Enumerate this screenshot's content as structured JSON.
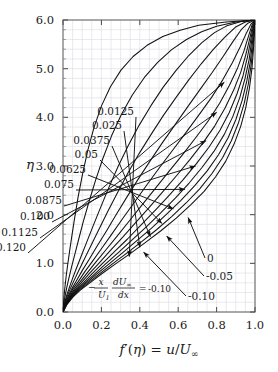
{
  "figure": {
    "background_color": "#ffffff",
    "frame_color": "#555555",
    "grid_color": "#d8d8e0",
    "curve_color": "#111111"
  },
  "chart_data": {
    "type": "line",
    "title": "",
    "subtitle": "",
    "xlabel": "f'(η) = u/U∞",
    "ylabel": "η",
    "xlim": [
      0.0,
      1.0
    ],
    "ylim": [
      0.0,
      6.0
    ],
    "xticks": [
      0.0,
      0.2,
      0.4,
      0.6,
      0.8,
      1.0
    ],
    "xtick_labels": [
      "0.0",
      "0.2",
      "0.4",
      "0.6",
      "0.8",
      "1.0"
    ],
    "yticks": [
      0.0,
      1.0,
      2.0,
      3.0,
      4.0,
      5.0,
      6.0
    ],
    "ytick_labels": [
      "0.0",
      "1.0",
      "2.0",
      "3.0",
      "4.0",
      "5.0",
      "6.0"
    ],
    "x_minor_step": 0.05,
    "y_minor_step": 0.2,
    "grid": true,
    "grid_style": "minor-only-light",
    "legend": "none",
    "annotation_parameter": "-(x/U1)(dU∞/dx)",
    "series": [
      {
        "name": "0.120",
        "label": "0.120",
        "beta": 0.12,
        "x": [
          0.0,
          0.02,
          0.05,
          0.09,
          0.14,
          0.2,
          0.27,
          0.35,
          0.43,
          0.51,
          0.59,
          0.665,
          0.735,
          0.795,
          0.848,
          0.891,
          0.926,
          0.952,
          0.971,
          0.984,
          0.992,
          0.997,
          1.0
        ],
        "y": [
          0.0,
          0.15,
          0.3,
          0.45,
          0.6,
          0.78,
          0.98,
          1.2,
          1.43,
          1.67,
          1.93,
          2.2,
          2.48,
          2.78,
          3.1,
          3.45,
          3.82,
          4.2,
          4.6,
          5.0,
          5.4,
          5.75,
          6.0
        ]
      },
      {
        "name": "0.1125",
        "label": "0.1125",
        "beta": 0.1125,
        "x": [
          0.0,
          0.018,
          0.046,
          0.084,
          0.131,
          0.188,
          0.254,
          0.329,
          0.408,
          0.487,
          0.566,
          0.641,
          0.712,
          0.775,
          0.831,
          0.877,
          0.915,
          0.944,
          0.965,
          0.98,
          0.99,
          0.996,
          1.0
        ],
        "y": [
          0.0,
          0.15,
          0.3,
          0.45,
          0.6,
          0.78,
          0.98,
          1.2,
          1.44,
          1.69,
          1.96,
          2.24,
          2.53,
          2.84,
          3.17,
          3.52,
          3.9,
          4.29,
          4.68,
          5.08,
          5.47,
          5.79,
          6.0
        ]
      },
      {
        "name": "0.100",
        "label": "0.100",
        "beta": 0.1,
        "x": [
          0.0,
          0.017,
          0.043,
          0.078,
          0.122,
          0.175,
          0.237,
          0.308,
          0.383,
          0.46,
          0.537,
          0.613,
          0.685,
          0.751,
          0.81,
          0.86,
          0.901,
          0.933,
          0.957,
          0.975,
          0.986,
          0.994,
          1.0
        ],
        "y": [
          0.0,
          0.15,
          0.3,
          0.45,
          0.6,
          0.78,
          0.98,
          1.21,
          1.46,
          1.72,
          2.0,
          2.29,
          2.59,
          2.9,
          3.23,
          3.58,
          3.96,
          4.35,
          4.74,
          5.13,
          5.51,
          5.81,
          6.0
        ]
      },
      {
        "name": "0.0875",
        "label": "0.0875",
        "beta": 0.0875,
        "x": [
          0.0,
          0.0155,
          0.04,
          0.073,
          0.114,
          0.164,
          0.222,
          0.288,
          0.36,
          0.434,
          0.51,
          0.585,
          0.657,
          0.724,
          0.786,
          0.84,
          0.885,
          0.921,
          0.948,
          0.969,
          0.982,
          0.992,
          1.0
        ],
        "y": [
          0.0,
          0.15,
          0.3,
          0.45,
          0.6,
          0.78,
          0.99,
          1.22,
          1.48,
          1.75,
          2.04,
          2.34,
          2.65,
          2.97,
          3.3,
          3.65,
          4.02,
          4.41,
          4.8,
          5.18,
          5.55,
          5.83,
          6.0
        ]
      },
      {
        "name": "0.075",
        "label": "0.075",
        "beta": 0.075,
        "x": [
          0.0,
          0.0145,
          0.037,
          0.068,
          0.106,
          0.152,
          0.206,
          0.268,
          0.336,
          0.407,
          0.48,
          0.554,
          0.626,
          0.695,
          0.759,
          0.817,
          0.866,
          0.906,
          0.938,
          0.961,
          0.978,
          0.99,
          1.0
        ],
        "y": [
          0.0,
          0.15,
          0.3,
          0.45,
          0.6,
          0.79,
          1.0,
          1.24,
          1.5,
          1.79,
          2.09,
          2.4,
          2.72,
          3.05,
          3.38,
          3.73,
          4.1,
          4.48,
          4.86,
          5.24,
          5.59,
          5.85,
          6.0
        ]
      },
      {
        "name": "0.0625",
        "label": "0.0625",
        "beta": 0.0625,
        "x": [
          0.0,
          0.0135,
          0.034,
          0.062,
          0.097,
          0.139,
          0.189,
          0.246,
          0.309,
          0.377,
          0.447,
          0.519,
          0.591,
          0.661,
          0.728,
          0.79,
          0.844,
          0.889,
          0.926,
          0.953,
          0.973,
          0.987,
          1.0
        ],
        "y": [
          0.0,
          0.15,
          0.3,
          0.45,
          0.61,
          0.8,
          1.01,
          1.26,
          1.53,
          1.83,
          2.14,
          2.47,
          2.8,
          3.13,
          3.47,
          3.82,
          4.19,
          4.56,
          4.93,
          5.3,
          5.63,
          5.87,
          6.0
        ]
      },
      {
        "name": "0.05",
        "label": "0.05",
        "beta": 0.05,
        "x": [
          0.0,
          0.0125,
          0.031,
          0.057,
          0.089,
          0.127,
          0.172,
          0.224,
          0.282,
          0.345,
          0.412,
          0.481,
          0.552,
          0.622,
          0.691,
          0.757,
          0.816,
          0.867,
          0.91,
          0.943,
          0.967,
          0.984,
          1.0
        ],
        "y": [
          0.0,
          0.15,
          0.3,
          0.46,
          0.62,
          0.81,
          1.03,
          1.28,
          1.56,
          1.87,
          2.2,
          2.54,
          2.89,
          3.23,
          3.58,
          3.93,
          4.29,
          4.66,
          5.02,
          5.37,
          5.68,
          5.89,
          6.0
        ]
      },
      {
        "name": "0.0375",
        "label": "0.0375",
        "beta": 0.0375,
        "x": [
          0.0,
          0.0112,
          0.028,
          0.051,
          0.08,
          0.114,
          0.155,
          0.202,
          0.254,
          0.311,
          0.373,
          0.438,
          0.505,
          0.574,
          0.643,
          0.71,
          0.774,
          0.832,
          0.882,
          0.923,
          0.955,
          0.978,
          1.0
        ],
        "y": [
          0.0,
          0.15,
          0.31,
          0.47,
          0.63,
          0.83,
          1.05,
          1.31,
          1.6,
          1.92,
          2.26,
          2.62,
          2.98,
          3.34,
          3.7,
          4.06,
          4.41,
          4.77,
          5.12,
          5.45,
          5.73,
          5.91,
          6.0
        ]
      },
      {
        "name": "0.025",
        "label": "0.025",
        "beta": 0.025,
        "x": [
          0.0,
          0.0098,
          0.0245,
          0.045,
          0.07,
          0.1,
          0.136,
          0.177,
          0.224,
          0.275,
          0.331,
          0.39,
          0.453,
          0.518,
          0.584,
          0.65,
          0.715,
          0.777,
          0.834,
          0.884,
          0.928,
          0.965,
          1.0
        ],
        "y": [
          0.0,
          0.15,
          0.31,
          0.47,
          0.64,
          0.85,
          1.08,
          1.35,
          1.65,
          1.99,
          2.35,
          2.72,
          3.1,
          3.48,
          3.85,
          4.22,
          4.58,
          4.92,
          5.25,
          5.55,
          5.8,
          5.94,
          6.0
        ]
      },
      {
        "name": "0.0125",
        "label": "0.0125",
        "beta": 0.0125,
        "x": [
          0.0,
          0.0082,
          0.0205,
          0.038,
          0.059,
          0.084,
          0.114,
          0.149,
          0.19,
          0.235,
          0.285,
          0.339,
          0.397,
          0.459,
          0.523,
          0.589,
          0.655,
          0.72,
          0.784,
          0.843,
          0.897,
          0.949,
          1.0
        ],
        "y": [
          0.0,
          0.15,
          0.31,
          0.48,
          0.66,
          0.87,
          1.11,
          1.39,
          1.72,
          2.08,
          2.46,
          2.86,
          3.26,
          3.65,
          4.04,
          4.41,
          4.77,
          5.1,
          5.4,
          5.65,
          5.85,
          5.96,
          6.0
        ]
      },
      {
        "name": "0",
        "label": "0",
        "beta": 0.0,
        "x": [
          0.0,
          0.0066,
          0.0166,
          0.031,
          0.048,
          0.069,
          0.094,
          0.123,
          0.157,
          0.196,
          0.239,
          0.287,
          0.34,
          0.397,
          0.458,
          0.522,
          0.588,
          0.655,
          0.722,
          0.789,
          0.853,
          0.928,
          1.0
        ],
        "y": [
          0.0,
          0.15,
          0.31,
          0.48,
          0.67,
          0.89,
          1.14,
          1.43,
          1.77,
          2.15,
          2.56,
          2.99,
          3.42,
          3.84,
          4.24,
          4.62,
          4.96,
          5.27,
          5.53,
          5.74,
          5.88,
          5.97,
          6.0
        ]
      },
      {
        "name": "-0.05",
        "label": "-0.05",
        "beta": -0.05,
        "x": [
          0.0,
          0.0042,
          0.0105,
          0.0196,
          0.031,
          0.045,
          0.062,
          0.082,
          0.106,
          0.135,
          0.169,
          0.208,
          0.253,
          0.304,
          0.361,
          0.424,
          0.493,
          0.566,
          0.643,
          0.722,
          0.8,
          0.9,
          1.0
        ],
        "y": [
          0.0,
          0.16,
          0.32,
          0.5,
          0.7,
          0.93,
          1.19,
          1.5,
          1.86,
          2.26,
          2.7,
          3.16,
          3.62,
          4.06,
          4.46,
          4.82,
          5.13,
          5.39,
          5.6,
          5.76,
          5.87,
          5.96,
          6.0
        ]
      },
      {
        "name": "-0.10",
        "label": "-0.10",
        "beta": -0.1,
        "x": [
          0.0,
          0.0021,
          0.0053,
          0.01,
          0.016,
          0.024,
          0.034,
          0.046,
          0.061,
          0.079,
          0.102,
          0.129,
          0.162,
          0.201,
          0.247,
          0.302,
          0.365,
          0.438,
          0.52,
          0.61,
          0.707,
          0.85,
          1.0
        ],
        "y": [
          0.0,
          0.16,
          0.33,
          0.51,
          0.72,
          0.96,
          1.24,
          1.56,
          1.94,
          2.37,
          2.84,
          3.32,
          3.8,
          4.24,
          4.63,
          4.97,
          5.25,
          5.48,
          5.66,
          5.79,
          5.89,
          5.96,
          6.0
        ]
      }
    ],
    "annotations": [
      {
        "label": "0.120",
        "text_x": 28,
        "text_y": 253,
        "tip_x": 0.84,
        "tip_y": 4.72
      },
      {
        "label": "0.1125",
        "text_x": 40,
        "text_y": 238,
        "tip_x": 0.8,
        "tip_y": 4.1
      },
      {
        "label": "0.100",
        "text_x": 52,
        "text_y": 222,
        "tip_x": 0.745,
        "tip_y": 3.52
      },
      {
        "label": "0.0875",
        "text_x": 64,
        "text_y": 206,
        "tip_x": 0.69,
        "tip_y": 3.0
      },
      {
        "label": "0.075",
        "text_x": 76,
        "text_y": 190,
        "tip_x": 0.635,
        "tip_y": 2.52
      },
      {
        "label": "0.0625",
        "text_x": 88,
        "text_y": 175,
        "tip_x": 0.575,
        "tip_y": 2.12
      },
      {
        "label": "0.05",
        "text_x": 100,
        "text_y": 160,
        "tip_x": 0.515,
        "tip_y": 1.82
      },
      {
        "label": "0.0375",
        "text_x": 112,
        "text_y": 146,
        "tip_x": 0.455,
        "tip_y": 1.55
      },
      {
        "label": "0.025",
        "text_x": 124,
        "text_y": 131,
        "tip_x": 0.4,
        "tip_y": 1.33
      },
      {
        "label": "0.0125",
        "text_x": 136,
        "text_y": 117,
        "tip_x": 0.345,
        "tip_y": 1.14
      },
      {
        "label": "0",
        "text_x": 205,
        "text_y": 258,
        "tip_x": 0.652,
        "tip_y": 1.94
      },
      {
        "label": "-0.05",
        "text_x": 204,
        "text_y": 276,
        "tip_x": 0.54,
        "tip_y": 1.56
      },
      {
        "label": "-0.10",
        "text_x": 186,
        "text_y": 296,
        "tip_x": 0.42,
        "tip_y": 1.23
      }
    ],
    "equation": {
      "minus": "−",
      "num1": "x",
      "den1": "U",
      "den1_sub": "1",
      "num2": "dU",
      "num2_sub": "∞",
      "den2": "dx",
      "equals": "=",
      "value": "-0.10",
      "full_text": "−(x/U₁)(dU∞/dx) = -0.10"
    }
  }
}
